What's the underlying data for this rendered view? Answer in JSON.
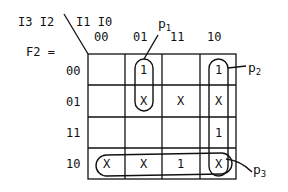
{
  "title": {
    "lhs": "F2 =",
    "row_vars": "I3 I2",
    "col_vars": "I1 I0"
  },
  "col_labels": [
    "00",
    "01",
    "11",
    "10"
  ],
  "row_labels": [
    "00",
    "01",
    "11",
    "10"
  ],
  "cells": [
    [
      "",
      "1",
      "",
      "1"
    ],
    [
      "",
      "X",
      "X",
      "X"
    ],
    [
      "",
      "",
      "",
      "1"
    ],
    [
      "X",
      "X",
      "1",
      "X"
    ]
  ],
  "groups": [
    {
      "name": "p",
      "sub": "1",
      "covers": "col 01, rows 00-01"
    },
    {
      "name": "p",
      "sub": "2",
      "covers": "col 10, rows 00-10"
    },
    {
      "name": "p",
      "sub": "3",
      "covers": "row 10, all cols"
    }
  ]
}
